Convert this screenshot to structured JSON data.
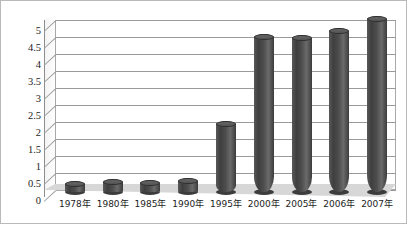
{
  "chart_data": {
    "type": "bar",
    "title": "",
    "subtitle": "",
    "xlabel": "",
    "ylabel": "",
    "categories": [
      "1978年",
      "1980年",
      "1985年",
      "1990年",
      "1995年",
      "2000年",
      "2005年",
      "2006年",
      "2007年"
    ],
    "values": [
      0.23,
      0.28,
      0.26,
      0.32,
      2.0,
      4.55,
      4.52,
      4.75,
      5.1
    ],
    "series": [
      {
        "name": "",
        "values": [
          0.23,
          0.28,
          0.26,
          0.32,
          2.0,
          4.55,
          4.52,
          4.75,
          5.1
        ]
      }
    ],
    "ylim": [
      0,
      5
    ],
    "ytick_labels": [
      "0",
      "0.5",
      "1",
      "1.5",
      "2",
      "2.5",
      "3",
      "3.5",
      "4",
      "4.5",
      "5"
    ],
    "ytick_values": [
      0,
      0.5,
      1,
      1.5,
      2,
      2.5,
      3,
      3.5,
      4,
      4.5,
      5
    ],
    "grid": true,
    "legend": false,
    "legend_position": "none",
    "style": "3d-cylinder",
    "colors": {
      "bar": "#4d4d4d",
      "bar_highlight": "#6a6a6a",
      "bar_shadow": "#3a3a3a",
      "plot_background": "#ffffff",
      "floor": "#d7d7d7",
      "gridline": "#9a9a9a",
      "axis": "#8e8e8e",
      "text": "#1d1d1d",
      "border": "#b9b9b9"
    }
  }
}
